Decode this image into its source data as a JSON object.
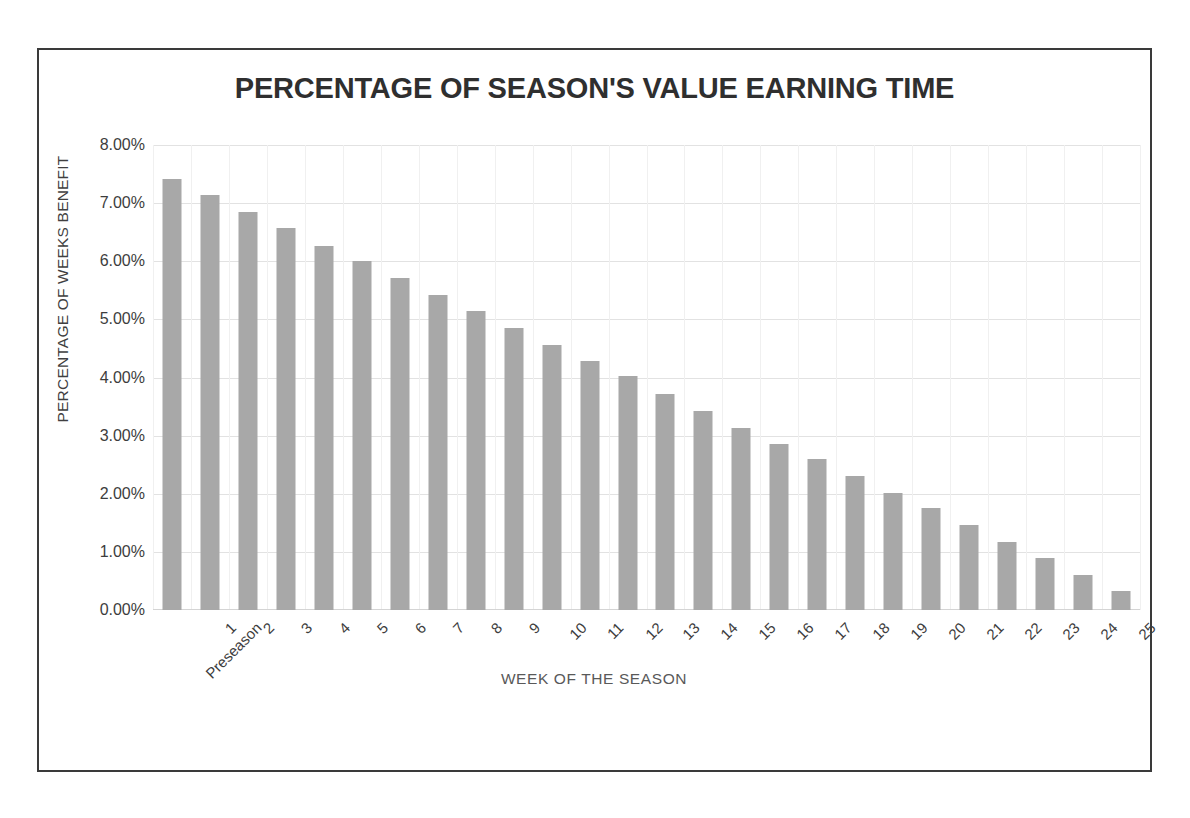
{
  "chart_data": {
    "type": "bar",
    "title": "PERCENTAGE OF SEASON'S VALUE EARNING TIME",
    "xlabel": "WEEK OF THE SEASON",
    "ylabel": "PERCENTAGE OF WEEKS BENEFIT",
    "categories": [
      "Preseason",
      "1",
      "2",
      "3",
      "4",
      "5",
      "6",
      "7",
      "8",
      "9",
      "10",
      "11",
      "12",
      "13",
      "14",
      "15",
      "16",
      "17",
      "18",
      "19",
      "20",
      "21",
      "22",
      "23",
      "24",
      "25"
    ],
    "values": [
      7.42,
      7.14,
      6.84,
      6.57,
      6.27,
      6.01,
      5.71,
      5.42,
      5.15,
      4.86,
      4.56,
      4.29,
      4.02,
      3.71,
      3.43,
      3.14,
      2.86,
      2.59,
      2.31,
      2.02,
      1.75,
      1.46,
      1.17,
      0.9,
      0.61,
      0.32
    ],
    "ylim": [
      0,
      8
    ],
    "ytick_labels": [
      "8.00%",
      "7.00%",
      "6.00%",
      "5.00%",
      "4.00%",
      "3.00%",
      "2.00%",
      "1.00%",
      "0.00%"
    ],
    "ytick_values": [
      8,
      7,
      6,
      5,
      4,
      3,
      2,
      1,
      0
    ],
    "value_suffix": "%",
    "grid": "horizontal-and-vertical",
    "legend": "none",
    "bar_color": "#a8a8a8",
    "gridline_color": "#e2e2e2",
    "frame_border_color": "#3a3a3a",
    "plot_background": "#ffffff",
    "text_color": "#3d3d3d"
  }
}
